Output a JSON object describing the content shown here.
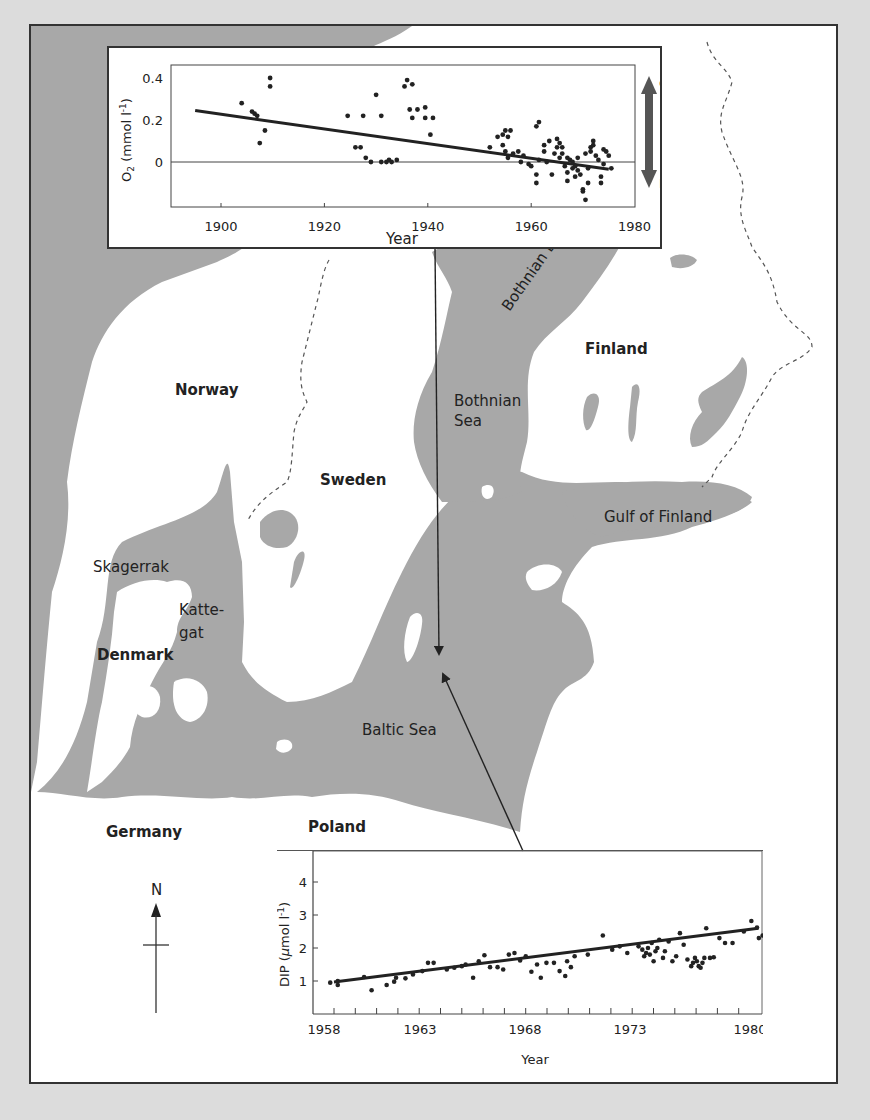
{
  "map": {
    "colors": {
      "sea": "#a8a8a8",
      "land": "#ffffff",
      "page_bg": "#dcdcdc",
      "frame": "#333333"
    },
    "labels": {
      "norway": "Norway",
      "sweden": "Sweden",
      "finland": "Finland",
      "denmark": "Denmark",
      "germany": "Germany",
      "poland": "Poland",
      "skagerrak": "Skagerrak",
      "kattegat_1": "Katte-",
      "kattegat_2": "gat",
      "bothnian_bay": "Bothnian Bay",
      "bothnian_sea_1": "Bothnian",
      "bothnian_sea_2": "Sea",
      "gulf_of_finland": "Gulf of Finland",
      "baltic_sea": "Baltic Sea"
    },
    "compass": {
      "label": "N"
    }
  },
  "chart_data": [
    {
      "type": "scatter",
      "title": "",
      "xlabel": "Year",
      "ylabel": "O2 (mmol l-1)",
      "ylabel_main": "O",
      "ylabel_sub": "2",
      "ylabel_rest": " (mmol l",
      "ylabel_sup": "-1",
      "ylabel_end": ")",
      "xlim": [
        1890,
        1980
      ],
      "ylim": [
        -0.21,
        0.46
      ],
      "xticks": [
        1900,
        1920,
        1940,
        1960,
        1980
      ],
      "yticks": [
        0,
        0.2,
        0.4
      ],
      "ytick_labels": [
        "0",
        "0.2",
        "0.4"
      ],
      "zero_line": true,
      "side_arrow": {
        "top_label": "O",
        "top_sub": "2",
        "bottom_label": "HS",
        "bottom_sup": "−"
      },
      "trend_line": {
        "x": [
          1895,
          1975
        ],
        "y": [
          0.245,
          -0.035
        ]
      },
      "points": [
        [
          1904,
          0.28
        ],
        [
          1906,
          0.24
        ],
        [
          1906.5,
          0.23
        ],
        [
          1907,
          0.22
        ],
        [
          1907.5,
          0.09
        ],
        [
          1908.5,
          0.15
        ],
        [
          1909.5,
          0.4
        ],
        [
          1909.5,
          0.36
        ],
        [
          1924.5,
          0.22
        ],
        [
          1926,
          0.07
        ],
        [
          1927,
          0.07
        ],
        [
          1927.5,
          0.22
        ],
        [
          1928,
          0.02
        ],
        [
          1929,
          0.0
        ],
        [
          1930,
          0.32
        ],
        [
          1931,
          0.22
        ],
        [
          1931,
          0.0
        ],
        [
          1932,
          0.0
        ],
        [
          1932.5,
          0.01
        ],
        [
          1933,
          0.0
        ],
        [
          1934,
          0.01
        ],
        [
          1935.5,
          0.36
        ],
        [
          1936,
          0.39
        ],
        [
          1936.5,
          0.25
        ],
        [
          1937,
          0.37
        ],
        [
          1937,
          0.21
        ],
        [
          1938,
          0.25
        ],
        [
          1939.5,
          0.26
        ],
        [
          1939.5,
          0.21
        ],
        [
          1940.5,
          0.13
        ],
        [
          1941,
          0.21
        ],
        [
          1952,
          0.07
        ],
        [
          1953.5,
          0.12
        ],
        [
          1954.5,
          0.13
        ],
        [
          1954.5,
          0.08
        ],
        [
          1955,
          0.15
        ],
        [
          1955,
          0.05
        ],
        [
          1955.5,
          0.12
        ],
        [
          1955.5,
          0.02
        ],
        [
          1956,
          0.15
        ],
        [
          1956.5,
          0.04
        ],
        [
          1957.5,
          0.05
        ],
        [
          1958,
          0.0
        ],
        [
          1958.5,
          0.03
        ],
        [
          1959.5,
          -0.01
        ],
        [
          1960,
          -0.02
        ],
        [
          1961,
          0.17
        ],
        [
          1961.5,
          0.19
        ],
        [
          1961,
          -0.06
        ],
        [
          1961,
          -0.1
        ],
        [
          1961.5,
          0.01
        ],
        [
          1962.5,
          0.08
        ],
        [
          1962.5,
          0.05
        ],
        [
          1963,
          0.0
        ],
        [
          1963.5,
          0.1
        ],
        [
          1964,
          -0.06
        ],
        [
          1964.5,
          0.04
        ],
        [
          1965,
          0.11
        ],
        [
          1965,
          0.07
        ],
        [
          1965.5,
          0.09
        ],
        [
          1965.5,
          0.02
        ],
        [
          1966,
          0.07
        ],
        [
          1966,
          0.04
        ],
        [
          1966.5,
          -0.02
        ],
        [
          1967,
          0.02
        ],
        [
          1967,
          -0.05
        ],
        [
          1967,
          -0.09
        ],
        [
          1967.5,
          0.01
        ],
        [
          1968,
          -0.03
        ],
        [
          1968,
          0.0
        ],
        [
          1968.5,
          -0.02
        ],
        [
          1968.5,
          -0.07
        ],
        [
          1969,
          0.02
        ],
        [
          1969,
          -0.04
        ],
        [
          1969.5,
          -0.06
        ],
        [
          1970,
          -0.13
        ],
        [
          1970,
          -0.14
        ],
        [
          1970.5,
          -0.18
        ],
        [
          1970.5,
          0.04
        ],
        [
          1971,
          -0.03
        ],
        [
          1971,
          -0.1
        ],
        [
          1971.5,
          0.07
        ],
        [
          1971.5,
          0.05
        ],
        [
          1972,
          0.1
        ],
        [
          1972,
          0.08
        ],
        [
          1972.5,
          0.03
        ],
        [
          1973,
          0.01
        ],
        [
          1973.5,
          -0.07
        ],
        [
          1973.5,
          -0.1
        ],
        [
          1974,
          0.06
        ],
        [
          1974,
          -0.01
        ],
        [
          1974.5,
          0.05
        ],
        [
          1975,
          0.03
        ],
        [
          1975.5,
          -0.03
        ]
      ]
    },
    {
      "type": "scatter",
      "title": "",
      "xlabel": "Year",
      "ylabel": "DIP (μmol l-1)",
      "ylabel_main": "DIP (",
      "ylabel_mu": "μ",
      "ylabel_rest": "mol l",
      "ylabel_sup": "-1",
      "ylabel_end": ")",
      "xlim": [
        1957,
        1981
      ],
      "ylim": [
        0,
        5
      ],
      "xtick_labels": [
        "1958",
        "1963",
        "1968",
        "1973",
        "1980"
      ],
      "xtick_label_positions_px": [
        11,
        107,
        212,
        317,
        437
      ],
      "minor_tick_count": 20,
      "yticks": [
        1,
        2,
        3,
        4
      ],
      "ytick_labels": [
        "1",
        "2",
        "3",
        "4"
      ],
      "trend_line": {
        "x": [
          1958,
          1981
        ],
        "y": [
          0.97,
          2.6
        ]
      },
      "points": [
        [
          1957.8,
          0.95
        ],
        [
          1958.2,
          1.0
        ],
        [
          1958.2,
          0.88
        ],
        [
          1959.6,
          1.12
        ],
        [
          1960,
          0.72
        ],
        [
          1960.8,
          0.88
        ],
        [
          1961.2,
          0.98
        ],
        [
          1961.3,
          1.1
        ],
        [
          1961.8,
          1.08
        ],
        [
          1962.2,
          1.2
        ],
        [
          1962.7,
          1.3
        ],
        [
          1963.0,
          1.55
        ],
        [
          1963.3,
          1.55
        ],
        [
          1964,
          1.35
        ],
        [
          1964.4,
          1.4
        ],
        [
          1964.8,
          1.45
        ],
        [
          1965.0,
          1.5
        ],
        [
          1965.4,
          1.1
        ],
        [
          1965.7,
          1.6
        ],
        [
          1966,
          1.78
        ],
        [
          1966.3,
          1.42
        ],
        [
          1966.7,
          1.42
        ],
        [
          1967,
          1.35
        ],
        [
          1967.3,
          1.8
        ],
        [
          1967.6,
          1.85
        ],
        [
          1967.9,
          1.62
        ],
        [
          1968.2,
          1.75
        ],
        [
          1968.5,
          1.28
        ],
        [
          1968.8,
          1.5
        ],
        [
          1969,
          1.1
        ],
        [
          1969.3,
          1.55
        ],
        [
          1969.7,
          1.55
        ],
        [
          1970.0,
          1.3
        ],
        [
          1970.3,
          1.15
        ],
        [
          1970.4,
          1.6
        ],
        [
          1970.6,
          1.42
        ],
        [
          1970.8,
          1.75
        ],
        [
          1971.5,
          1.8
        ],
        [
          1972.3,
          2.38
        ],
        [
          1972.8,
          1.95
        ],
        [
          1973.2,
          2.05
        ],
        [
          1973.6,
          1.85
        ],
        [
          1974.2,
          2.05
        ],
        [
          1974.4,
          1.95
        ],
        [
          1974.5,
          1.75
        ],
        [
          1974.6,
          1.85
        ],
        [
          1974.7,
          2.0
        ],
        [
          1974.8,
          1.8
        ],
        [
          1974.9,
          2.15
        ],
        [
          1975,
          1.6
        ],
        [
          1975.1,
          1.9
        ],
        [
          1975.2,
          2.0
        ],
        [
          1975.3,
          2.25
        ],
        [
          1975.5,
          1.7
        ],
        [
          1975.6,
          1.9
        ],
        [
          1975.8,
          2.2
        ],
        [
          1976,
          1.6
        ],
        [
          1976.2,
          1.75
        ],
        [
          1976.4,
          2.45
        ],
        [
          1976.6,
          2.1
        ],
        [
          1976.8,
          1.65
        ],
        [
          1977.0,
          1.45
        ],
        [
          1977.1,
          1.55
        ],
        [
          1977.2,
          1.7
        ],
        [
          1977.3,
          1.6
        ],
        [
          1977.4,
          1.45
        ],
        [
          1977.5,
          1.4
        ],
        [
          1977.6,
          1.55
        ],
        [
          1977.7,
          1.7
        ],
        [
          1977.8,
          2.6
        ],
        [
          1978,
          1.7
        ],
        [
          1978.2,
          1.72
        ],
        [
          1978.5,
          2.3
        ],
        [
          1978.8,
          2.15
        ],
        [
          1979.2,
          2.15
        ],
        [
          1979.8,
          2.5
        ],
        [
          1980.2,
          2.82
        ],
        [
          1980.5,
          2.62
        ],
        [
          1980.6,
          2.3
        ],
        [
          1980.8,
          2.38
        ],
        [
          1981.0,
          1.98
        ],
        [
          1981.2,
          2.28
        ]
      ]
    }
  ]
}
